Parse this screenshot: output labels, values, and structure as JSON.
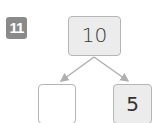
{
  "problem": {
    "number": "11"
  },
  "number_bond": {
    "whole": "10",
    "parts": [
      "",
      "5"
    ]
  },
  "colors": {
    "badge": "#8a8a8a",
    "box_border": "#b5b5b5",
    "box_fill": "#ececec",
    "arrow": "#b0b0b0"
  }
}
